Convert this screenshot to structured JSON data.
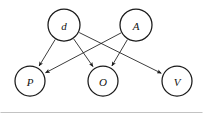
{
  "figure": {
    "type": "directed-acyclic-graph",
    "width": 203,
    "height": 114,
    "background_color": "#ffffff",
    "node_fill_color": "#ffffff",
    "node_stroke_color": "#1a1a1a",
    "edge_color": "#1a1a1a",
    "label_color": "#111111",
    "frame_color": "#9a9a9a"
  },
  "nodes": [
    {
      "id": "d",
      "label": "d",
      "cx": 64,
      "cy": 25,
      "r": 16
    },
    {
      "id": "A",
      "label": "A",
      "cx": 136,
      "cy": 25,
      "r": 16
    },
    {
      "id": "P",
      "label": "P",
      "cx": 30,
      "cy": 81,
      "r": 15
    },
    {
      "id": "O",
      "label": "O",
      "cx": 103,
      "cy": 81,
      "r": 15
    },
    {
      "id": "V",
      "label": "V",
      "cx": 177,
      "cy": 81,
      "r": 15
    }
  ],
  "edges": [
    {
      "id": "d-to-P",
      "from": "d",
      "to": "P",
      "arrow": "to"
    },
    {
      "id": "d-to-O",
      "from": "d",
      "to": "O",
      "arrow": "to"
    },
    {
      "id": "d-to-V",
      "from": "d",
      "to": "V",
      "arrow": "to"
    },
    {
      "id": "A-to-P",
      "from": "A",
      "to": "P",
      "arrow": "to"
    },
    {
      "id": "A-to-O",
      "from": "A",
      "to": "O",
      "arrow": "to"
    }
  ],
  "chart_data": {
    "type": "diagram",
    "title": "",
    "nodes": [
      "d",
      "A",
      "P",
      "O",
      "V"
    ],
    "edges": [
      [
        "d",
        "P"
      ],
      [
        "d",
        "O"
      ],
      [
        "d",
        "V"
      ],
      [
        "A",
        "P"
      ],
      [
        "A",
        "O"
      ]
    ],
    "directed": true,
    "layout": "two-row",
    "top_row": [
      "d",
      "A"
    ],
    "bottom_row": [
      "P",
      "O",
      "V"
    ]
  }
}
